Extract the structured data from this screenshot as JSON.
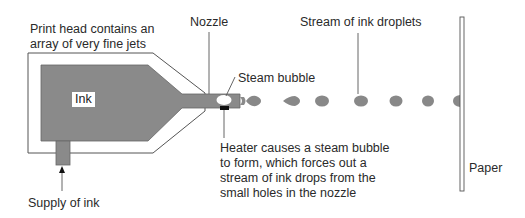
{
  "diagram": {
    "labels": {
      "print_head": [
        "Print head contains an",
        "array of very fine jets"
      ],
      "nozzle": "Nozzle",
      "droplets": "Stream of ink droplets",
      "steam_bubble": "Steam bubble",
      "ink": "Ink",
      "heater": [
        "Heater causes a steam bubble",
        "to form, which forces out a",
        "stream of ink drops from the",
        "small holes in the nozzle"
      ],
      "paper": "Paper",
      "supply": "Supply of ink"
    },
    "colors": {
      "ink": "#8a8a8a",
      "outline": "#555555",
      "heater": "#111111",
      "bubble": "#ffffff",
      "background": "#ffffff"
    },
    "droplet_count": 7
  }
}
